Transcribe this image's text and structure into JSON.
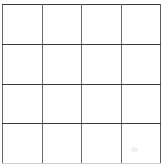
{
  "figure": {
    "kind": "blank-grid",
    "title": "",
    "rows": 4,
    "columns": 4,
    "cell_count": 16,
    "background_color": "#ffffff",
    "horizontal_line_color": "#3b3b3b",
    "vertical_line_color": "#6d6d6d",
    "bottom_edge_color": "#cfcfcf",
    "line_width_px": 1,
    "grid_left_px": 2,
    "grid_top_px": 4,
    "grid_width_px": 155,
    "grid_height_px": 160,
    "cell_width_px": 38.5,
    "cell_height_px": 39.5
  },
  "grid": {
    "row_labels": [
      "row-1",
      "row-2",
      "row-3",
      "row-4"
    ],
    "column_labels": [
      "col-1",
      "col-2",
      "col-3",
      "col-4"
    ],
    "cells": [
      [
        "",
        "",
        "",
        ""
      ],
      [
        "",
        "",
        "",
        ""
      ],
      [
        "",
        "",
        "",
        ""
      ],
      [
        "",
        "",
        "",
        ""
      ]
    ]
  },
  "artifacts": {
    "smudge_visible": true,
    "smudge_left_px": 131,
    "smudge_top_px": 147,
    "smudge_color": "#f0f0f0"
  }
}
